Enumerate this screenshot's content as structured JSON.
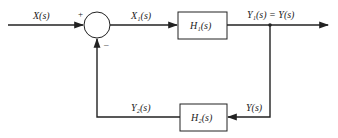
{
  "diagram": {
    "type": "feedback-block-diagram",
    "colors": {
      "line": "#222222",
      "box_fill": "#ffffff",
      "background": "#ffffff"
    },
    "signals": {
      "input": "X(s)",
      "error": "X₁(s)",
      "output": "Y₁(s) = Y(s)",
      "feedback_in": "Y(s)",
      "feedback_out": "Y₂(s)"
    },
    "summing_junction": {
      "plus_sign": "+",
      "minus_sign": "–"
    },
    "blocks": {
      "forward": "H₁(s)",
      "feedback": "H₂(s)"
    }
  }
}
